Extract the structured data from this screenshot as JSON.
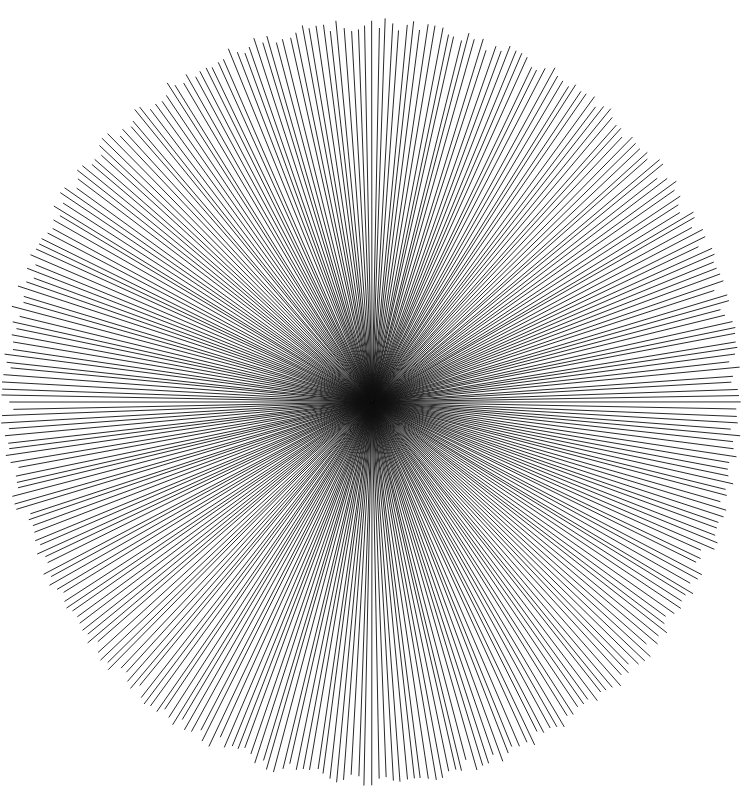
{
  "canvas": {
    "width": 745,
    "height": 792,
    "background_color": "#ffffff",
    "title": "Radial Starburst"
  },
  "figure": {
    "type": "radial-starburst",
    "center": {
      "x": 372,
      "y": 402
    },
    "rays": {
      "count": 340,
      "stroke_color": "#111111",
      "stroke_width": 0.9,
      "inner_radius": 0,
      "start_angle_deg": -90,
      "angular_step_deg": 1.0588235294117647,
      "radius_x": 365,
      "radius_y": 377,
      "length_jitter": 7,
      "angle_jitter_deg": 0.16,
      "jitter_seed": 20250411
    },
    "core": {
      "emergent": true,
      "approx_radius": 60,
      "color": "#000000",
      "note": "not drawn separately - produced by ray convergence"
    }
  }
}
